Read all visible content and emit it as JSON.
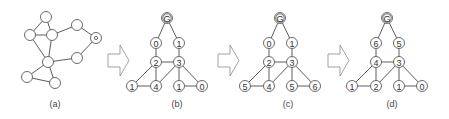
{
  "figure": {
    "panels": [
      {
        "id": "a",
        "caption": "(a)"
      },
      {
        "id": "b",
        "caption": "(b)"
      },
      {
        "id": "c",
        "caption": "(c)"
      },
      {
        "id": "d",
        "caption": "(d)"
      }
    ],
    "graph_a": {
      "nodes": [
        {
          "id": "top",
          "x": 46,
          "y": 17
        },
        {
          "id": "left-mid",
          "x": 30,
          "y": 35
        },
        {
          "id": "right-mid",
          "x": 52,
          "y": 35
        },
        {
          "id": "upper-right",
          "x": 77,
          "y": 25
        },
        {
          "id": "marked",
          "x": 96,
          "y": 38,
          "marked": true
        },
        {
          "id": "lower-right",
          "x": 77,
          "y": 58
        },
        {
          "id": "center",
          "x": 48,
          "y": 62
        },
        {
          "id": "bottom-left",
          "x": 27,
          "y": 77
        },
        {
          "id": "bottom-right",
          "x": 55,
          "y": 83
        }
      ],
      "edges": [
        [
          "top",
          "left-mid"
        ],
        [
          "top",
          "right-mid"
        ],
        [
          "left-mid",
          "right-mid"
        ],
        [
          "left-mid",
          "center"
        ],
        [
          "right-mid",
          "center"
        ],
        [
          "right-mid",
          "upper-right"
        ],
        [
          "upper-right",
          "marked"
        ],
        [
          "marked",
          "lower-right"
        ],
        [
          "lower-right",
          "center"
        ],
        [
          "center",
          "bottom-left"
        ],
        [
          "center",
          "bottom-right"
        ],
        [
          "bottom-left",
          "bottom-right"
        ]
      ]
    },
    "trees": [
      {
        "panel": "b",
        "root": "G",
        "level1": [
          "0",
          "1"
        ],
        "level2": [
          "2",
          "3"
        ],
        "leaves": [
          "1",
          "4",
          "1",
          "0"
        ]
      },
      {
        "panel": "c",
        "root": "G",
        "level1": [
          "0",
          "1"
        ],
        "level2": [
          "2",
          "3"
        ],
        "leaves": [
          "5",
          "4",
          "5",
          "6"
        ]
      },
      {
        "panel": "d",
        "root": "G",
        "level1": [
          "6",
          "5"
        ],
        "level2": [
          "4",
          "3"
        ],
        "leaves": [
          "1",
          "2",
          "1",
          "0"
        ]
      }
    ],
    "arrows": [
      "arrow-right",
      "arrow-right",
      "arrow-right"
    ],
    "colors": {
      "stroke": "#4a4a4a",
      "arrow_stroke": "#8a8a8a",
      "background": "#ffffff"
    }
  }
}
